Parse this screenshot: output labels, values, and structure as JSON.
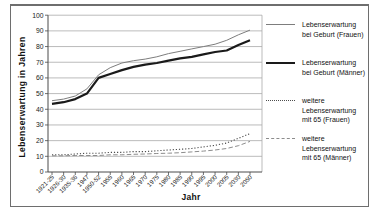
{
  "figure": {
    "background_color": "#ffffff",
    "border_color": "#6e6e6e"
  },
  "chart_data": {
    "type": "line",
    "title": "",
    "xlabel": "Jahr",
    "ylabel": "Lebenserwartung in Jahren",
    "ylim": [
      0,
      100
    ],
    "ytick_step": 10,
    "grid": true,
    "gridline_color": "#a9a9a9",
    "axis_color": "#4a4a4a",
    "legend_position": "right",
    "categories": [
      "1921-25",
      "1926-30",
      "1935-36",
      "1947",
      "1950-52",
      "1955",
      "1960",
      "1965",
      "1970",
      "1975",
      "1980",
      "1985",
      "1990",
      "1995",
      "2000",
      "2005",
      "2030",
      "2050"
    ],
    "series": [
      {
        "id": "frauen-geburt",
        "name": "Lebenserwartung bei Geburt (Frauen)",
        "legend_label": "Lebenserwartung\nbei Geburt (Frauen)",
        "style": "thin-solid",
        "color": "#7d7d7d",
        "values": [
          45.5,
          46.5,
          48.5,
          53,
          62,
          66.5,
          69.5,
          71,
          72,
          73.5,
          75.5,
          77,
          78.5,
          80,
          81.5,
          84,
          87.5,
          90.5
        ]
      },
      {
        "id": "maenner-geburt",
        "name": "Lebenserwartung bei Geburt (Männer)",
        "legend_label": "Lebenserwartung\nbei Geburt (Männer)",
        "style": "thick-solid",
        "color": "#1a1a1a",
        "values": [
          43.5,
          44.5,
          46.5,
          50,
          60,
          62.5,
          65,
          67,
          68.5,
          69.5,
          71,
          72.5,
          73.5,
          75,
          76.5,
          77.5,
          81,
          84
        ]
      },
      {
        "id": "frauen-65",
        "name": "weitere Lebenserwartung mit 65 (Frauen)",
        "legend_label": "weitere\nLebenserwartung\nmit 65 (Frauen)",
        "style": "dotted",
        "color": "#4d4d4d",
        "values": [
          11,
          11,
          11.5,
          12,
          12,
          12.5,
          12.5,
          13,
          13,
          13.5,
          14,
          14.5,
          15,
          16,
          17,
          18.5,
          21.5,
          24.5
        ]
      },
      {
        "id": "maenner-65",
        "name": "weitere Lebenserwartung mit 65 (Männer)",
        "legend_label": "weitere\nLebenserwartung\nmit 65 (Männer)",
        "style": "dashed",
        "color": "#8c8c8c",
        "values": [
          10.3,
          10.3,
          10.5,
          10.5,
          10.5,
          11,
          11,
          11.3,
          11.5,
          11.8,
          12,
          12.3,
          12.8,
          13.3,
          14,
          15,
          16.8,
          19.5
        ]
      }
    ]
  }
}
